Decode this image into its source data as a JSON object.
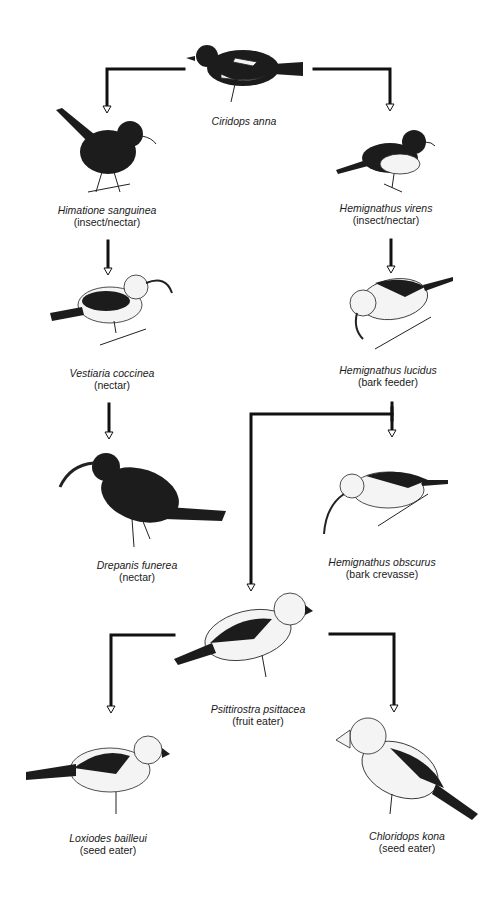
{
  "diagram": {
    "type": "evolutionary-radiation",
    "colors": {
      "line": "#111111",
      "text": "#1a1a1a",
      "background": "#ffffff"
    },
    "nodes": [
      {
        "id": "ciridops",
        "name": "Ciridops anna",
        "diet": ""
      },
      {
        "id": "himatione",
        "name": "Himatione sanguinea",
        "diet": "(insect/nectar)"
      },
      {
        "id": "hemignathus-virens",
        "name": "Hemignathus virens",
        "diet": "(insect/nectar)"
      },
      {
        "id": "vestiaria",
        "name": "Vestiaria coccinea",
        "diet": "(nectar)"
      },
      {
        "id": "hemignathus-lucidus",
        "name": "Hemignathus lucidus",
        "diet": "(bark feeder)"
      },
      {
        "id": "drepanis",
        "name": "Drepanis funerea",
        "diet": "(nectar)"
      },
      {
        "id": "hemignathus-obscurus",
        "name": "Hemignathus obscurus",
        "diet": "(bark crevasse)"
      },
      {
        "id": "psittirostra",
        "name": "Psittirostra psittacea",
        "diet": "(fruit eater)"
      },
      {
        "id": "loxiodes",
        "name": "Loxiodes bailleui",
        "diet": "(seed eater)"
      },
      {
        "id": "chloridops",
        "name": "Chloridops kona",
        "diet": "(seed eater)"
      }
    ],
    "edges": [
      {
        "from": "ciridops",
        "to": "himatione"
      },
      {
        "from": "ciridops",
        "to": "hemignathus-virens"
      },
      {
        "from": "himatione",
        "to": "vestiaria"
      },
      {
        "from": "vestiaria",
        "to": "drepanis"
      },
      {
        "from": "hemignathus-virens",
        "to": "hemignathus-lucidus"
      },
      {
        "from": "hemignathus-lucidus",
        "to": "hemignathus-obscurus"
      },
      {
        "from": "hemignathus-lucidus",
        "to": "psittirostra"
      },
      {
        "from": "psittirostra",
        "to": "loxiodes"
      },
      {
        "from": "psittirostra",
        "to": "chloridops"
      }
    ]
  }
}
